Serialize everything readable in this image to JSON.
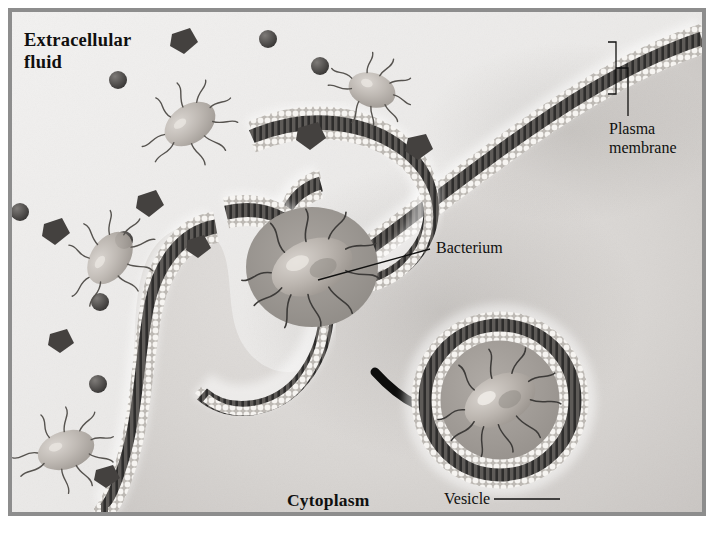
{
  "figure": {
    "type": "biological-diagram",
    "frame_color": "#8d8d8d",
    "background_color": "#eceaea"
  },
  "labels": {
    "extracellular_fluid": "Extracellular\nfluid",
    "plasma_membrane": "Plasma\nmembrane",
    "bacterium": "Bacterium",
    "cytoplasm": "Cytoplasm",
    "vesicle": "Vesicle"
  },
  "colors": {
    "extracellular_bg": "#e9e7e6",
    "cytoplasm_bg": "#d9d6d4",
    "membrane_head": "#f4f2ef",
    "membrane_tail": "#3b3a38",
    "membrane_core": "#5d5b58",
    "particle_dark": "#4a4846",
    "bacterium_body": "#b9b3ad",
    "flagella": "#3d3b39",
    "arrow": "#0d0d0c",
    "text": "#10100f"
  },
  "elements": {
    "membrane_bilayer": "phospholipid bilayer with two rows of round heads and dark tails",
    "pseudopod_left": "membrane arm curving down the left side",
    "pseudopod_upper": "membrane arm sweeping from upper-left to upper-right",
    "engulfed_bacterium": "rod-shaped bacterium with flagella inside forming pocket",
    "vesicle_circle": "closed circular bilayer vesicle containing a bacterium",
    "transition_arrow": "thick curved arrow pointing right",
    "plasma_membrane_bracket": "bracket marking membrane thickness at top right"
  },
  "extracellular_particles": {
    "spheres": 7,
    "crystals": 9,
    "free_bacteria": 5
  }
}
